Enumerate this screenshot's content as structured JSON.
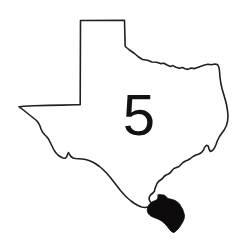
{
  "figure": {
    "kind": "state-outline-map",
    "background_color": "#ffffff",
    "width": 248,
    "height": 247
  },
  "map": {
    "outline": {
      "name": "texas-state-outline",
      "stroke_color": "#241f1f",
      "fill_color": "#ffffff",
      "stroke_width": 1.6
    },
    "highlight": {
      "name": "highlighted-region",
      "location": "southern-gulf-coast",
      "fill_color": "#0d0b0b",
      "label": ""
    }
  },
  "annotation": {
    "number_label": "5",
    "color": "#141111",
    "position": "center"
  }
}
